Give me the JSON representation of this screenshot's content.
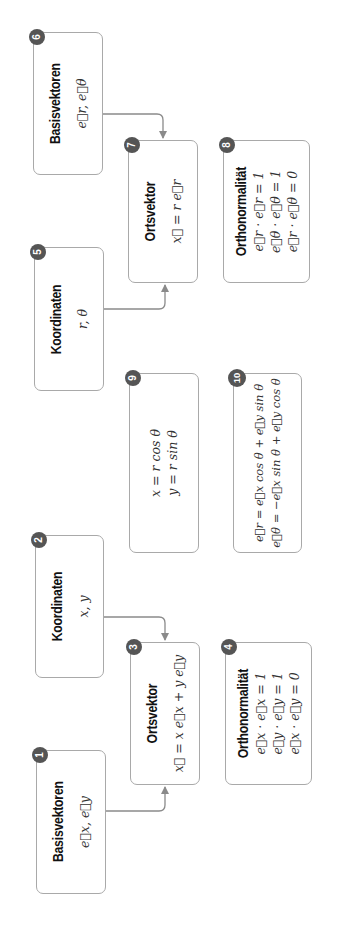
{
  "diagram": {
    "orientation": "rotated 90 degrees counter-clockwise",
    "cartesian": {
      "basisvektoren": {
        "number": "1",
        "title": "Basisvektoren",
        "formula": "e⃗x, e⃗y"
      },
      "koordinaten": {
        "number": "2",
        "title": "Koordinaten",
        "formula": "x, y"
      },
      "ortsvektor": {
        "number": "3",
        "title": "Ortsvektor",
        "formula": "x⃗ = x e⃗x + y e⃗y"
      },
      "orthonormalitaet": {
        "number": "4",
        "title": "Orthonormalität",
        "lines": [
          "e⃗x · e⃗x = 1",
          "e⃗y · e⃗y = 1",
          "e⃗x · e⃗y = 0"
        ]
      }
    },
    "polar": {
      "koordinaten": {
        "number": "5",
        "title": "Koordinaten",
        "formula": "r, θ"
      },
      "basisvektoren": {
        "number": "6",
        "title": "Basisvektoren",
        "formula": "e⃗r, e⃗θ"
      },
      "ortsvektor": {
        "number": "7",
        "title": "Ortsvektor",
        "formula": "x⃗ = r e⃗r"
      },
      "orthonormalitaet": {
        "number": "8",
        "title": "Orthonormalität",
        "lines": [
          "e⃗r · e⃗r = 1",
          "e⃗θ · e⃗θ = 1",
          "e⃗r · e⃗θ = 0"
        ]
      }
    },
    "transformations": {
      "coordinates": {
        "number": "9",
        "lines": [
          "x = r cos θ",
          "y = r sin θ"
        ]
      },
      "basis": {
        "number": "10",
        "lines": [
          "e⃗r = e⃗x cos θ + e⃗y sin θ",
          "e⃗θ = −e⃗x sin θ + e⃗y cos θ"
        ]
      }
    },
    "edges": [
      {
        "from": "1",
        "to": "3"
      },
      {
        "from": "2",
        "to": "3"
      },
      {
        "from": "5",
        "to": "7"
      },
      {
        "from": "6",
        "to": "7"
      }
    ],
    "colors": {
      "border": "#a9a9a9",
      "badge": "#555555",
      "arrow": "#8a8a8a"
    }
  }
}
